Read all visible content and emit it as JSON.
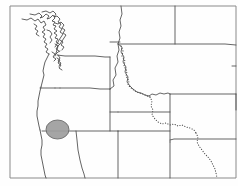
{
  "figure": {
    "kind": "line-art-map",
    "width": 238,
    "height": 186,
    "background_color": "#fefefe"
  },
  "frame": {
    "name": "map-border-frame",
    "stroke_color": "#8a8a8a",
    "visible_edges": [
      "left",
      "top",
      "bottom",
      "right"
    ]
  },
  "legend_text": {
    "title": "",
    "subtitle": "",
    "caption": "",
    "labels": []
  },
  "layers": [
    {
      "id": "coastline",
      "label": "Pacific coastline",
      "stroke_color": "#3a3a3a",
      "style": "solid"
    },
    {
      "id": "state-borders",
      "label": "State boundaries",
      "stroke_color": "#4a4a4a",
      "style": "solid"
    },
    {
      "id": "continental-divide",
      "label": "Dotted boundary",
      "stroke_color": "#545454",
      "style": "dotted"
    },
    {
      "id": "marker",
      "label": "Shaded circular area marker",
      "fill_color": "#9d9d9d",
      "stroke_color": "#6a6a6a",
      "style": "filled-circle"
    }
  ],
  "marker": {
    "name": "shaded-area-marker",
    "center_x": 57.5,
    "center_y": 129.5,
    "radius_x": 11.5,
    "radius_y": 9.5,
    "fill_color": "#9d9d9d",
    "stroke_color": "#6a6a6a"
  },
  "geometry": {
    "frame_paths": [
      "M 10 6 L 10 178",
      "M 10 6 L 236 6",
      "M 10 178 L 236 178",
      "M 236 6 L 236 178"
    ],
    "coastline_paths": [
      "M 22 19 L 27 20 L 31 18 L 35 21 L 38 19 L 41 23 L 44 21 L 46 25 L 43 27 L 45 30 L 42 32 L 45 34 L 43 37 L 46 39 L 44 42 L 47 44 L 45 47 L 48 49 L 46 52 L 49 54",
      "M 30 14 L 35 15 L 39 13 L 42 16 L 40 18 L 43 17 L 46 14 L 49 16 L 47 19 L 50 18 L 53 15 L 55 18 L 52 21 L 55 22 L 53 25 L 56 26 L 54 29 L 57 31 L 54 33 L 57 35 L 55 38 L 58 39 L 56 42 L 59 44",
      "M 42 12 L 46 11 L 50 13 L 53 11 L 56 14 L 54 17 L 57 16 L 60 19 L 58 22 L 61 24 L 59 27 L 62 29 L 60 32 L 63 34 L 61 37 L 59 40 L 57 44 L 55 47",
      "M 49 54 L 47 58 L 45 62 L 44 66 L 43 71 L 44 75 L 43 79 L 42 83 L 41 87",
      "M 41 87 L 40 91 L 39 96 L 38 101 L 38 106 L 37 111 L 37 116 L 38 121 L 39 126 L 40 130",
      "M 40 130 L 41 135 L 42 140 L 42 145 L 41 150 L 41 155 L 42 160 L 43 165 L 44 170 L 45 175 L 46 178",
      "M 55 23 L 58 24 L 61 22 L 64 25 L 62 28 L 65 30 L 63 33 L 66 35 L 64 38 L 62 41 L 60 44 L 58 46",
      "M 58 46 L 57 50 L 56 53 L 55 56",
      "M 47 30 L 50 31 L 52 34 L 50 37 L 52 40 L 50 43",
      "M 34 24 L 37 26 L 35 29 L 38 31 L 36 34 L 39 36",
      "M 52 52 L 55 54 L 53 57 L 56 59 L 54 61",
      "M 58 55 L 60 58 L 58 61 L 61 63 L 59 66",
      "M 55 44 L 58 46 L 56 49 L 59 51",
      "M 60 40 L 63 42 L 61 45 L 64 47 L 62 50",
      "M 57 58 L 60 60 L 58 63 L 61 65 L 59 68 L 62 70"
    ],
    "state_border_paths": [
      "M 57 55 L 65 56 L 75 56 L 85 56 L 95 56 L 105 57 L 110 57",
      "M 56 54 L 58 52 L 60 51",
      "M 60 88 L 70 88 L 80 88 L 90 88 L 100 89 L 108 89 L 110 89",
      "M 110 57 L 110 70 L 110 80 L 110 89",
      "M 55 88 L 58 88 L 60 88",
      "M 40 88 L 45 88 L 50 88 L 55 88",
      "M 42 131 L 52 131 L 62 131 L 72 131 L 82 131 L 92 131 L 102 131 L 110 131 L 118 131",
      "M 110 89 L 110 100 L 110 112 L 110 131",
      "M 110 89 L 114 86 L 113 80 L 116 75 L 115 68 L 118 62 L 117 56 L 119 50 L 118 44 L 120 38 L 119 32 L 121 26 L 120 20 L 122 14 L 121 6",
      "M 110 42 L 115 42 L 120 42",
      "M 118 44 L 125 44 L 135 44 L 145 44 L 155 44 L 165 44 L 175 44 L 185 44 L 195 44 L 205 44 L 215 44 L 225 44 L 236 45",
      "M 175 6 L 175 20 L 175 32 L 175 44",
      "M 118 44 L 122 47 L 121 52 L 124 57 L 123 62 L 126 67 L 125 72 L 128 77 L 127 82 L 130 86 L 133 89 L 137 92 L 141 93 L 145 95 L 149 96",
      "M 149 96 L 152 94 L 156 95 L 160 93 L 164 94 L 168 93 L 170 94",
      "M 170 94 L 180 94 L 190 94 L 200 94 L 210 94 L 220 94 L 230 94 L 236 94",
      "M 170 94 L 170 105 L 170 118 L 170 131 L 170 142",
      "M 236 139 L 228 139 L 220 139 L 212 139 L 204 139 L 196 139 L 188 139 L 180 139 L 174 139 L 170 140",
      "M 118 131 L 125 131 L 132 131 L 140 131 L 148 131 L 156 131 L 162 131 L 170 131",
      "M 118 131 L 118 140 L 118 150 L 118 162 L 118 172 L 118 178",
      "M 76 131 L 77 140 L 78 150 L 80 160 L 82 168 L 84 174 L 85 178",
      "M 170 142 L 170 152 L 170 162 L 170 172 L 170 178",
      "M 110 112 L 118 112",
      "M 236 94 L 236 110",
      "M 236 66 L 232 66",
      "M 118 112 L 125 112 L 132 112 L 140 112 L 148 112 L 156 112 L 162 112 L 170 112"
    ],
    "divide_paths": [
      "M 121 46 L 123 51 L 122 56 L 125 61 L 124 66 L 127 71 L 126 76 L 129 81 L 128 85 L 131 88 L 135 91 L 139 93 L 143 94 L 147 96 L 150 97",
      "M 150 97 L 152 101 L 151 106 L 153 110 L 152 115 L 155 119 L 158 122 L 162 124 L 166 123 L 170 125 L 174 124 L 178 126 L 182 125 L 186 127 L 190 128 L 194 130 L 196 133",
      "M 196 133 L 198 137 L 197 142 L 199 146 L 202 150 L 205 154 L 208 157 L 211 161 L 213 165 L 215 169 L 216 173 L 217 178"
    ]
  }
}
